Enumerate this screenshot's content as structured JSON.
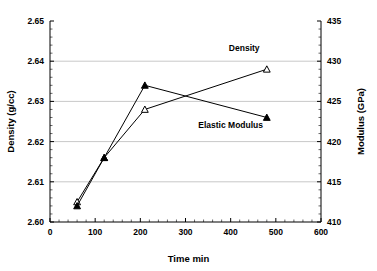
{
  "chart_data": {
    "type": "line",
    "title": "",
    "xlabel": "Time min",
    "ylabel": "Density (g/cc)",
    "y2label": "Modulus (GPa)",
    "xlim": [
      0,
      600
    ],
    "ylim": [
      2.6,
      2.65
    ],
    "y2lim": [
      410,
      435
    ],
    "xticks": [
      0,
      100,
      200,
      300,
      400,
      500,
      600
    ],
    "xticklabels": [
      "0",
      "100",
      "200",
      "300",
      "400",
      "500",
      "600"
    ],
    "yticks": [
      2.6,
      2.61,
      2.62,
      2.63,
      2.64,
      2.65
    ],
    "yticklabels": [
      "2.60",
      "2.61",
      "2.62",
      "2.63",
      "2.64",
      "2.65"
    ],
    "y2ticks": [
      410,
      415,
      420,
      425,
      430,
      435
    ],
    "y2ticklabels": [
      "410",
      "415",
      "420",
      "425",
      "430",
      "435"
    ],
    "grid": "horizontal",
    "legend_position": "inline-annotation",
    "series": [
      {
        "name": "Density",
        "axis": "left",
        "marker": "open-triangle",
        "x": [
          60,
          120,
          210,
          480
        ],
        "values": [
          2.605,
          2.616,
          2.628,
          2.638
        ],
        "annotation": "Density"
      },
      {
        "name": "Elastic Modulus",
        "axis": "right",
        "marker": "filled-triangle",
        "x": [
          60,
          120,
          210,
          480
        ],
        "values": [
          412.0,
          418.0,
          427.0,
          423.0
        ],
        "annotation": "Elastic Modulus"
      }
    ],
    "annotations": [
      {
        "text": "Density",
        "x": 430,
        "y": 2.6425
      },
      {
        "text": "Elastic Modulus",
        "x": 400,
        "y": 2.6235
      }
    ],
    "colors": {
      "line": "#000000",
      "grid": "#b0b0b0",
      "axis": "#000000",
      "background": "#ffffff"
    }
  }
}
